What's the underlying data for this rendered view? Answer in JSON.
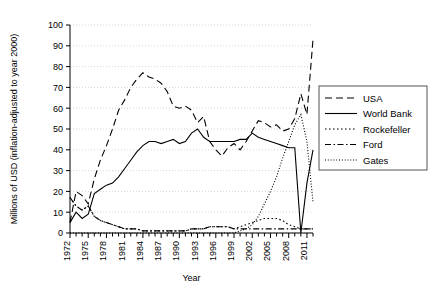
{
  "chart_data": {
    "type": "line",
    "title": "",
    "xlabel": "Year",
    "ylabel": "Millions of USD (inflation-adjusted to year 2000)",
    "xlim": [
      1972,
      2012
    ],
    "ylim": [
      0,
      100
    ],
    "ytick_labels": [
      "0",
      "10",
      "20",
      "30",
      "40",
      "50",
      "60",
      "70",
      "80",
      "90",
      "100"
    ],
    "ytick_values": [
      0,
      10,
      20,
      30,
      40,
      50,
      60,
      70,
      80,
      90,
      100
    ],
    "xtick_labels": [
      "1972",
      "1975",
      "1978",
      "1981",
      "1984",
      "1987",
      "1990",
      "1993",
      "1996",
      "1999",
      "2002",
      "2005",
      "2008",
      "2011"
    ],
    "xtick_values": [
      1972,
      1975,
      1978,
      1981,
      1984,
      1987,
      1990,
      1993,
      1996,
      1999,
      2002,
      2005,
      2008,
      2011
    ],
    "x": [
      1972,
      1973,
      1974,
      1975,
      1976,
      1977,
      1978,
      1979,
      1980,
      1981,
      1982,
      1983,
      1984,
      1985,
      1986,
      1987,
      1988,
      1989,
      1990,
      1991,
      1992,
      1993,
      1994,
      1995,
      1996,
      1997,
      1998,
      1999,
      2000,
      2001,
      2002,
      2003,
      2004,
      2005,
      2006,
      2007,
      2008,
      2009,
      2010,
      2011,
      2012
    ],
    "grid": true,
    "legend_position": "right",
    "series": [
      {
        "name": "USA",
        "style": "dashed",
        "values": [
          5,
          20,
          18,
          14,
          26,
          35,
          42,
          50,
          59,
          64,
          70,
          74,
          77,
          75,
          74,
          72,
          68,
          61,
          60,
          61,
          59,
          53,
          56,
          44,
          40,
          37,
          41,
          43,
          40,
          44,
          49,
          54,
          53,
          51,
          52,
          49,
          50,
          55,
          67,
          57,
          93
        ]
      },
      {
        "name": "World Bank",
        "style": "solid",
        "values": [
          5,
          10,
          7,
          9,
          19,
          21,
          23,
          24,
          27,
          31,
          35,
          39,
          42,
          44,
          44,
          43,
          44,
          45,
          43,
          44,
          48,
          50,
          46,
          44,
          44,
          44,
          44,
          44,
          45,
          45,
          48,
          46,
          45,
          44,
          43,
          42,
          41,
          41,
          0,
          24,
          40
        ]
      },
      {
        "name": "Rockefeller",
        "style": "dotted",
        "values": [
          17,
          13,
          11,
          13,
          8,
          6,
          5,
          4,
          3,
          2,
          2,
          2,
          1,
          1,
          1,
          1,
          1,
          1,
          1,
          1,
          2,
          2,
          2,
          3,
          3,
          3,
          3,
          2,
          3,
          4,
          5,
          6,
          7,
          7,
          7,
          6,
          4,
          3,
          2,
          2,
          2
        ]
      },
      {
        "name": "Ford",
        "style": "dashdot",
        "values": [
          17,
          13,
          11,
          13,
          8,
          6,
          5,
          4,
          3,
          2,
          2,
          2,
          1,
          1,
          1,
          1,
          1,
          1,
          1,
          1,
          2,
          2,
          2,
          3,
          3,
          3,
          3,
          2,
          2,
          2,
          2,
          2,
          2,
          2,
          2,
          2,
          2,
          2,
          2,
          2,
          2
        ]
      },
      {
        "name": "Gates",
        "style": "finedotted",
        "values": [
          0,
          0,
          0,
          0,
          0,
          0,
          0,
          0,
          0,
          0,
          0,
          0,
          0,
          0,
          0,
          0,
          0,
          0,
          0,
          0,
          0,
          0,
          0,
          0,
          0,
          0,
          0,
          0,
          1,
          2,
          4,
          8,
          14,
          20,
          27,
          36,
          44,
          52,
          57,
          44,
          15
        ]
      }
    ]
  },
  "legend": {
    "entries": [
      {
        "label": "USA"
      },
      {
        "label": "World Bank"
      },
      {
        "label": "Rockefeller"
      },
      {
        "label": "Ford"
      },
      {
        "label": "Gates"
      }
    ]
  },
  "colors": {
    "line": "#000000",
    "grid": "#cccccc",
    "axis": "#000000",
    "background": "#ffffff"
  }
}
